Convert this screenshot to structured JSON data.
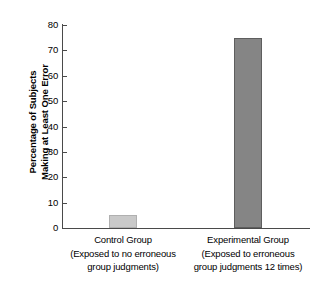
{
  "chart_data": {
    "type": "bar",
    "title": "",
    "xlabel": "",
    "ylabel": "Percentage of Subjects Making at Least One Error",
    "ylim": [
      0,
      80
    ],
    "yticks": [
      0,
      10,
      20,
      30,
      40,
      50,
      60,
      70,
      80
    ],
    "grid": false,
    "legend": "none",
    "categories": [
      "Control Group",
      "Experimental Group"
    ],
    "values": [
      5,
      75
    ],
    "bars": [
      {
        "category": "Control Group",
        "sublabel_line1": "(Exposed to no erroneous",
        "sublabel_line2": "group judgments)",
        "value": 5,
        "fill": "#c9c9c9",
        "stroke": "#b0b0b0"
      },
      {
        "category": "Experimental Group",
        "sublabel_line1": "(Exposed to erroneous",
        "sublabel_line2": "group judgments 12 times)",
        "value": 75,
        "fill": "#858585",
        "stroke": "#5e5e5e"
      }
    ]
  },
  "axis": {
    "y_title_line1": "Percentage of Subjects",
    "y_title_line2": "Making at Least One Error",
    "tick_labels": [
      "0",
      "10",
      "20",
      "30",
      "40",
      "50",
      "60",
      "70",
      "80"
    ],
    "axis_color": "#4a4a4a"
  }
}
